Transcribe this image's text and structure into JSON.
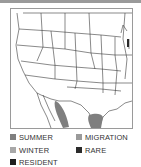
{
  "map": {
    "region": "United States and northern Mexico range map",
    "colors": {
      "summer": "#808080",
      "winter": "#a6a6a6",
      "resident": "#2b2b2b",
      "migration": "#9a9a9a",
      "rare": "#2b2b2b",
      "border": "#3a3a3a"
    }
  },
  "legend": {
    "items": [
      {
        "key": "summer",
        "label": "SUMMER",
        "color": "#7f7f7f"
      },
      {
        "key": "migration",
        "label": "MIGRATION",
        "color": "#9a9a9a"
      },
      {
        "key": "winter",
        "label": "WINTER",
        "color": "#a8a8a8"
      },
      {
        "key": "rare",
        "label": "RARE",
        "color": "#2b2b2b"
      },
      {
        "key": "resident",
        "label": "RESIDENT",
        "color": "#1e1e1e"
      }
    ]
  }
}
